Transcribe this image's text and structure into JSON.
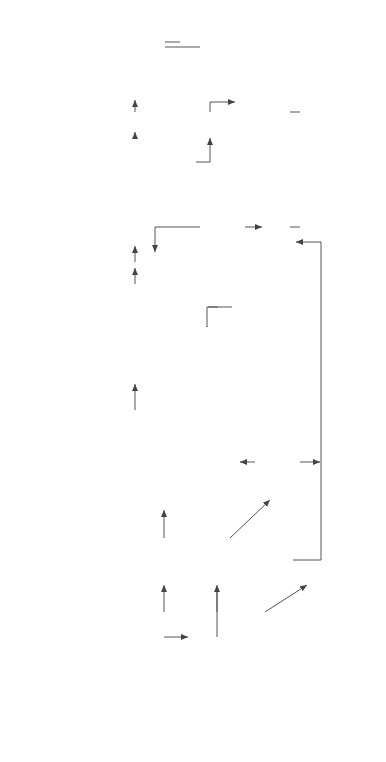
{
  "questions": [
    {
      "label": "1 What is the problem and is it significant?"
    },
    {
      "label": "2 Is it amenable to change?"
    },
    {
      "label": "3 Are the intervention's benefits greater than costs?"
    },
    {
      "label": "4 Is there acceptance for the interventions?"
    },
    {
      "label": "5 What actions are recommended?"
    }
  ],
  "nodes": {
    "identification": {
      "lines": [
        "Identification of the problem and target group",
        "Epidemiology",
        "Cost to the community",
        "Community perceptions"
      ]
    },
    "yes": {
      "label": "Yes"
    },
    "unknown": {
      "label": "Unknown"
    },
    "no": {
      "label": "No"
    },
    "pilot_research": {
      "label": "Pilot research"
    },
    "develop": {
      "title": "Develop Interventions and outcome-based objectives:",
      "bullets": [
        "policy",
        "education",
        "environmental"
      ]
    },
    "assess": {
      "title": "Assess the intervention's:",
      "bullets": [
        "social impact",
        "ethics",
        "economic costs",
        "efficacy"
      ]
    },
    "discontinue": {
      "label": "Discontinue"
    },
    "acceptance": {
      "label": "Acceptance by the target group, community, politicians, industry"
    },
    "implement": {
      "label": "Implement public health measure"
    },
    "advocate": {
      "label": "Advocate for public health measure"
    },
    "monitor": {
      "label": "Monitor the problem, evaluate the interventions and change if required"
    }
  },
  "edge_labels": {
    "yes_bc": [
      "Yes",
      "B>C"
    ],
    "unknown_pilot": [
      "Unknown",
      "Pilot interventions"
    ],
    "no_bc": [
      "No",
      "B<C"
    ],
    "a_gt_0": "A>0",
    "a_lt_0": "A<0"
  },
  "colors": {
    "line": "#555555",
    "shadow": "#bdbdbd",
    "text": "#3a3a3a"
  }
}
